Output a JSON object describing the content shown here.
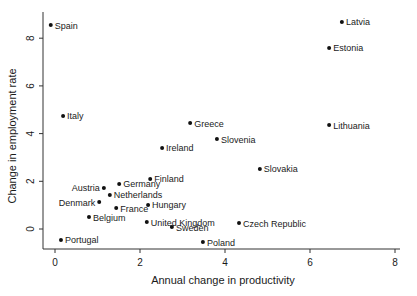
{
  "chart_data": {
    "type": "scatter",
    "title": "",
    "xlabel": "Annual change in productivity",
    "ylabel": "Change in employment rate",
    "xlim": [
      -0.3,
      8.1
    ],
    "ylim": [
      -0.7,
      9.0
    ],
    "xticks": [
      0,
      2,
      4,
      6,
      8
    ],
    "yticks": [
      0,
      2,
      4,
      6,
      8
    ],
    "grid": false,
    "legend": null,
    "points": [
      {
        "label": "Spain",
        "x": -0.1,
        "y": 8.55
      },
      {
        "label": "Latvia",
        "x": 6.75,
        "y": 8.68
      },
      {
        "label": "Estonia",
        "x": 6.45,
        "y": 7.59
      },
      {
        "label": "Italy",
        "x": 0.19,
        "y": 4.74
      },
      {
        "label": "Greece",
        "x": 3.18,
        "y": 4.44
      },
      {
        "label": "Lithuania",
        "x": 6.45,
        "y": 4.36
      },
      {
        "label": "Slovenia",
        "x": 3.81,
        "y": 3.77
      },
      {
        "label": "Ireland",
        "x": 2.52,
        "y": 3.4
      },
      {
        "label": "Slovakia",
        "x": 4.82,
        "y": 2.52
      },
      {
        "label": "Finland",
        "x": 2.24,
        "y": 2.1
      },
      {
        "label": "Germany",
        "x": 1.51,
        "y": 1.89
      },
      {
        "label": "Austria",
        "x": 1.15,
        "y": 1.72
      },
      {
        "label": "Netherlands",
        "x": 1.29,
        "y": 1.43
      },
      {
        "label": "Denmark",
        "x": 1.04,
        "y": 1.13
      },
      {
        "label": "Hungary",
        "x": 2.19,
        "y": 1.01
      },
      {
        "label": "France",
        "x": 1.44,
        "y": 0.88
      },
      {
        "label": "Belgium",
        "x": 0.8,
        "y": 0.5
      },
      {
        "label": "United Kingdom",
        "x": 2.16,
        "y": 0.29
      },
      {
        "label": "Czech Republic",
        "x": 4.33,
        "y": 0.25
      },
      {
        "label": "Sweden",
        "x": 2.75,
        "y": 0.08
      },
      {
        "label": "Portugal",
        "x": 0.14,
        "y": -0.46
      },
      {
        "label": "Poland",
        "x": 3.48,
        "y": -0.55
      }
    ]
  },
  "labels": {
    "left": [
      "Austria",
      "Denmark"
    ]
  },
  "colors": {
    "marker": "#111111",
    "axis": "#333333",
    "text": "#1a1a1a",
    "background": "#ffffff"
  }
}
